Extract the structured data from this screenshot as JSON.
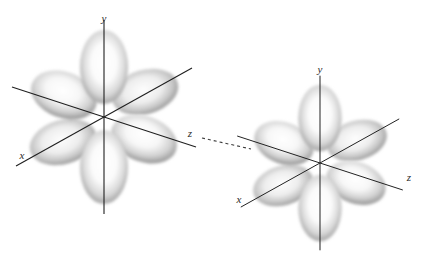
{
  "figure": {
    "title": "",
    "background_color": "#ffffff",
    "width": 429,
    "height": 265,
    "axis_color": "#1f1f1f",
    "lobe_color_dark": "#8c8c8c",
    "lobe_color_light": "#ffffff",
    "connector_color": "#3a3a3a"
  },
  "orbitals": [
    {
      "name": "left-orbital",
      "center_x": 104,
      "center_y": 117,
      "scale": 1.0,
      "labels": {
        "y": "y",
        "x": "x",
        "z": "z"
      },
      "label_positions": {
        "y": {
          "x": 104,
          "y": 22
        },
        "x": {
          "x": 22,
          "y": 159
        },
        "z": {
          "x": 190,
          "y": 137
        }
      }
    },
    {
      "name": "right-orbital",
      "center_x": 320,
      "center_y": 163,
      "scale": 0.9,
      "labels": {
        "y": "y",
        "x": "x",
        "z": "z"
      },
      "label_positions": {
        "y": {
          "x": 320,
          "y": 73
        },
        "x": {
          "x": 239,
          "y": 203
        },
        "z": {
          "x": 409,
          "y": 181
        }
      }
    }
  ],
  "connector": {
    "name": "dashed-interaction-line",
    "x1": 202,
    "y1": 138,
    "x2": 250,
    "y2": 149,
    "dash_pattern": "3 3"
  }
}
